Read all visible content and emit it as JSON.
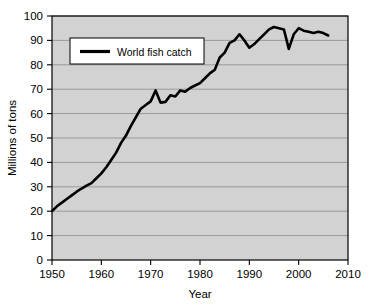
{
  "chart_data": {
    "type": "line",
    "title": "",
    "xlabel": "Year",
    "ylabel": "Millions of tons",
    "xlim": [
      1950,
      2010
    ],
    "ylim": [
      0,
      100
    ],
    "xticks": [
      1950,
      1960,
      1970,
      1980,
      1990,
      2000,
      2010
    ],
    "yticks": [
      0,
      10,
      20,
      30,
      40,
      50,
      60,
      70,
      80,
      90,
      100
    ],
    "xtick_labels": [
      "1950",
      "1960",
      "1970",
      "1980",
      "1990",
      "2000",
      "2010"
    ],
    "ytick_labels": [
      "0",
      "10",
      "20",
      "30",
      "40",
      "50",
      "60",
      "70",
      "80",
      "90",
      "100"
    ],
    "grid": "horizontal",
    "legend_position": "top-left-inside",
    "series": [
      {
        "name": "World fish catch",
        "color": "#000000",
        "x": [
          1950,
          1951,
          1952,
          1953,
          1954,
          1955,
          1956,
          1957,
          1958,
          1959,
          1960,
          1961,
          1962,
          1963,
          1964,
          1965,
          1966,
          1967,
          1968,
          1969,
          1970,
          1971,
          1972,
          1973,
          1974,
          1975,
          1976,
          1977,
          1978,
          1979,
          1980,
          1981,
          1982,
          1983,
          1984,
          1985,
          1986,
          1987,
          1988,
          1989,
          1990,
          1991,
          1992,
          1993,
          1994,
          1995,
          1996,
          1997,
          1998,
          1999,
          2000,
          2001,
          2002,
          2003,
          2004,
          2005,
          2006
        ],
        "y": [
          20.0,
          22.0,
          23.5,
          25.0,
          26.5,
          28.0,
          29.3,
          30.5,
          31.5,
          33.5,
          35.5,
          38.0,
          41.0,
          44.0,
          48.0,
          51.0,
          55.0,
          58.5,
          62.0,
          63.5,
          65.0,
          69.5,
          64.5,
          64.8,
          67.5,
          67.0,
          69.5,
          69.0,
          70.5,
          71.5,
          72.5,
          74.5,
          76.5,
          78.0,
          83.0,
          85.0,
          89.0,
          90.0,
          92.5,
          90.0,
          87.0,
          88.5,
          90.5,
          92.5,
          94.5,
          95.5,
          95.0,
          94.5,
          86.5,
          92.5,
          95.0,
          94.0,
          93.5,
          93.0,
          93.5,
          93.0,
          92.0
        ]
      }
    ]
  },
  "legend": {
    "entries": [
      {
        "label": "World fish catch"
      }
    ]
  },
  "axes": {
    "x_title": "Year",
    "y_title": "Millions of tons"
  },
  "style": {
    "plot_background": "#d2d2d2",
    "page_background": "#ffffff",
    "grid_color": "#8c8c8c",
    "axis_color": "#000000",
    "line_color": "#000000",
    "legend_background": "#ffffff"
  }
}
